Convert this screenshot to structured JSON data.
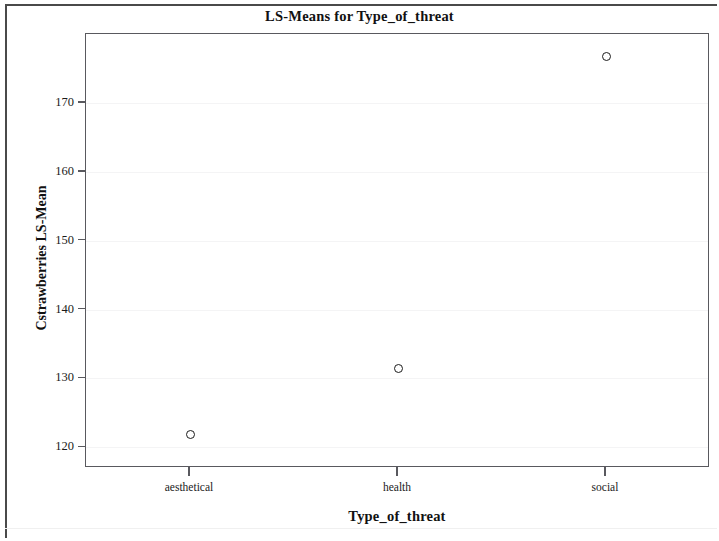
{
  "chart_data": {
    "type": "scatter",
    "title": "LS-Means for Type_of_threat",
    "xlabel": "Type_of_threat",
    "ylabel": "Cstrawberries LS-Mean",
    "categories": [
      "aesthetical",
      "health",
      "social"
    ],
    "values": [
      121.8,
      131.5,
      176.7
    ],
    "series": [
      {
        "name": "Cstrawberries LS-Mean",
        "values": [
          121.8,
          131.5,
          176.7
        ],
        "marker": "open-circle",
        "marker_color": "#1c1c1c"
      }
    ],
    "ylim": [
      117,
      180
    ],
    "yticks": [
      120,
      130,
      140,
      150,
      160,
      170
    ],
    "ytick_labels": [
      "120",
      "130",
      "140",
      "150",
      "160",
      "170"
    ],
    "xticks": [
      "aesthetical",
      "health",
      "social"
    ],
    "grid": "faint-horizontal",
    "legend": "none"
  },
  "frame": {
    "border_color": "#59595e",
    "background": "#ffffff"
  }
}
